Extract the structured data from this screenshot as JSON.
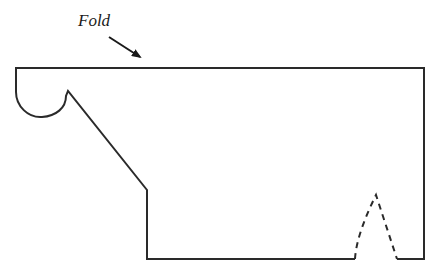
{
  "diagram": {
    "type": "pattern-cutout",
    "labels": {
      "fold": "Fold"
    },
    "colors": {
      "stroke": "#2a2a2a",
      "background": "#ffffff"
    },
    "elements": [
      {
        "name": "fold-label",
        "text": "Fold"
      },
      {
        "name": "fold-arrow",
        "points_to": "fold-line"
      },
      {
        "name": "fold-line",
        "style": "solid"
      },
      {
        "name": "pattern-outline",
        "style": "solid"
      },
      {
        "name": "dart",
        "style": "dashed"
      }
    ]
  }
}
